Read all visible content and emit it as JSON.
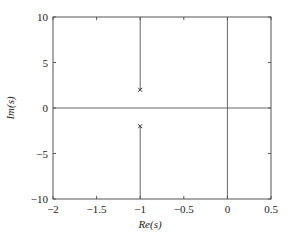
{
  "chart_data": {
    "type": "scatter",
    "title": "",
    "xlabel": "Re(s)",
    "ylabel": "Im(s)",
    "xlim": [
      -2,
      0.5
    ],
    "ylim": [
      -10,
      10
    ],
    "xticks": [
      -2,
      -1.5,
      -1,
      -0.5,
      0,
      0.5
    ],
    "xtick_labels": [
      "−2",
      "−1.5",
      "−1",
      "−0.5",
      "0",
      "0.5"
    ],
    "yticks": [
      -10,
      -5,
      0,
      5,
      10
    ],
    "ytick_labels": [
      "−10",
      "−5",
      "0",
      "5",
      "10"
    ],
    "grid": false,
    "legend": null,
    "series": [
      {
        "name": "poles",
        "marker": "x",
        "points": [
          {
            "x": -1,
            "y": 2
          },
          {
            "x": -1,
            "y": -2
          }
        ]
      }
    ],
    "lines": [
      {
        "name": "root-locus-upper-branch",
        "x": [
          -1,
          -1
        ],
        "y": [
          2,
          10
        ]
      },
      {
        "name": "root-locus-lower-branch",
        "x": [
          -1,
          -1
        ],
        "y": [
          -2,
          -10
        ]
      },
      {
        "name": "real-axis",
        "x": [
          -2,
          0.5
        ],
        "y": [
          0,
          0
        ]
      },
      {
        "name": "imaginary-axis",
        "x": [
          0,
          0
        ],
        "y": [
          -10,
          10
        ]
      }
    ]
  },
  "style": {
    "axis_color": "#555555",
    "line_color": "#666666",
    "marker_color": "#333333"
  }
}
